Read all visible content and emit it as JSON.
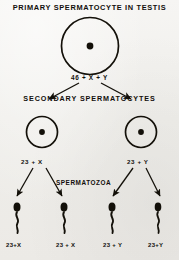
{
  "diagram": {
    "title": "PRIMARY SPERMATOCYTE IN TESTIS",
    "background_color": "#f2f1ef",
    "ink_color": "#131009",
    "stages": [
      {
        "name": "primary-spermatocyte",
        "heading": "PRIMARY SPERMATOCYTE IN TESTIS",
        "cell_count": 1,
        "chromosome_label": "46 + X + Y"
      },
      {
        "name": "secondary-spermatocytes",
        "heading": "SECONDARY SPERMATOCYTES",
        "cell_count": 2,
        "chromosome_labels": [
          "23 + X",
          "23 + Y"
        ]
      },
      {
        "name": "spermatozoa",
        "heading": "SPERMATOZOA",
        "cell_count": 4,
        "chromosome_labels": [
          "23+X",
          "23 + X",
          "23 + Y",
          "23+Y"
        ]
      }
    ],
    "headings": {
      "primary": "PRIMARY SPERMATOCYTE IN TESTIS",
      "secondary": "SECONDARY SPERMATOCYTES",
      "spermatozoa": "SPERMATOZOA"
    },
    "labels": {
      "primary_count": "46 + X + Y",
      "secondary_left": "23 + X",
      "secondary_right": "23 + Y",
      "sperm": [
        "23+X",
        "23 + X",
        "23 + Y",
        "23+Y"
      ]
    }
  }
}
